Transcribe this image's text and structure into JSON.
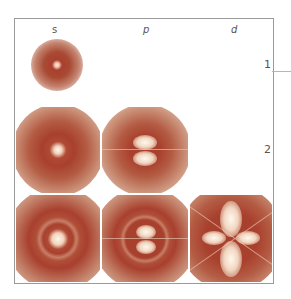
{
  "diagram": {
    "columns": [
      {
        "label": "s"
      },
      {
        "label": "p"
      },
      {
        "label": "d"
      }
    ],
    "rows": [
      {
        "label": "1"
      },
      {
        "label": "2"
      },
      {
        "label": "3"
      }
    ],
    "cells": [
      {
        "row": "1",
        "col": "s",
        "name": "1s orbital"
      },
      {
        "row": "2",
        "col": "s",
        "name": "2s orbital"
      },
      {
        "row": "2",
        "col": "p",
        "name": "2p orbital"
      },
      {
        "row": "3",
        "col": "s",
        "name": "3s orbital"
      },
      {
        "row": "3",
        "col": "p",
        "name": "3p orbital"
      },
      {
        "row": "3",
        "col": "d",
        "name": "3d orbital"
      }
    ],
    "colors": {
      "orbital_dark": "#a8402e",
      "orbital_light": "#f3dcc8",
      "frame": "#9a9a9a",
      "marker_line": "#e8a0a8"
    }
  }
}
